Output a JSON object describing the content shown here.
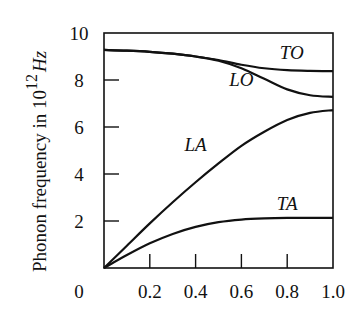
{
  "chart_data": {
    "type": "line",
    "title": "",
    "xlabel": "",
    "ylabel": "Phonon frequency in 10^12 Hz",
    "ylabel_parts": {
      "text": "Phonon frequency in  10",
      "sup": "12",
      "unit": "Hz"
    },
    "xlim": [
      0,
      1.0
    ],
    "ylim": [
      0,
      10
    ],
    "grid": false,
    "legend": "inline labels",
    "x_ticks": [
      0.2,
      0.4,
      0.6,
      0.8
    ],
    "x_tick_labels": [
      "0",
      "0.2",
      "0.4",
      "0.6",
      "0.8",
      "1.0"
    ],
    "y_ticks": [
      2,
      4,
      6,
      8
    ],
    "y_tick_labels": [
      "2",
      "4",
      "6",
      "8",
      "10"
    ],
    "x": [
      0,
      0.1,
      0.2,
      0.3,
      0.4,
      0.5,
      0.6,
      0.7,
      0.8,
      0.9,
      1.0
    ],
    "series": [
      {
        "name": "TO",
        "values": [
          9.28,
          9.25,
          9.2,
          9.12,
          9.0,
          8.85,
          8.65,
          8.5,
          8.42,
          8.39,
          8.38
        ],
        "label_pos": [
          0.82,
          8.9
        ]
      },
      {
        "name": "LO",
        "values": [
          9.28,
          9.25,
          9.2,
          9.12,
          9.0,
          8.82,
          8.5,
          8.05,
          7.6,
          7.35,
          7.28
        ],
        "label_pos": [
          0.6,
          7.75
        ]
      },
      {
        "name": "LA",
        "values": [
          0,
          0.95,
          1.9,
          2.8,
          3.65,
          4.45,
          5.2,
          5.8,
          6.3,
          6.6,
          6.72
        ],
        "label_pos": [
          0.4,
          5.0
        ]
      },
      {
        "name": "TA",
        "values": [
          0,
          0.55,
          1.05,
          1.45,
          1.75,
          1.95,
          2.06,
          2.11,
          2.13,
          2.13,
          2.13
        ],
        "label_pos": [
          0.8,
          2.45
        ]
      }
    ]
  },
  "axes": {
    "origin_label": "0"
  }
}
